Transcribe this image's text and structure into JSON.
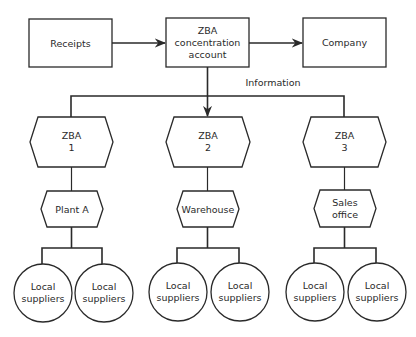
{
  "diagram": {
    "type": "flowchart",
    "colors": {
      "stroke": "#2a2a2a",
      "fill": "#ffffff",
      "text": "#2a2a2a"
    },
    "top_row": {
      "receipts": {
        "label": "Receipts"
      },
      "concentration": {
        "line1": "ZBA",
        "line2": "concentration",
        "line3": "account"
      },
      "company": {
        "label": "Company"
      }
    },
    "information_label": "Information",
    "branches": [
      {
        "zba": {
          "line1": "ZBA",
          "line2": "1"
        },
        "unit": {
          "line1": "Plant A",
          "line2": ""
        },
        "suppliers": [
          {
            "line1": "Local",
            "line2": "suppliers"
          },
          {
            "line1": "Local",
            "line2": "suppliers"
          }
        ]
      },
      {
        "zba": {
          "line1": "ZBA",
          "line2": "2"
        },
        "unit": {
          "line1": "Warehouse",
          "line2": ""
        },
        "suppliers": [
          {
            "line1": "Local",
            "line2": "suppliers"
          },
          {
            "line1": "Local",
            "line2": "suppliers"
          }
        ]
      },
      {
        "zba": {
          "line1": "ZBA",
          "line2": "3"
        },
        "unit": {
          "line1": "Sales",
          "line2": "office"
        },
        "suppliers": [
          {
            "line1": "Local",
            "line2": "suppliers"
          },
          {
            "line1": "Local",
            "line2": "suppliers"
          }
        ]
      }
    ],
    "edges": [
      {
        "from": "Receipts",
        "to": "ZBA concentration account",
        "arrow": true
      },
      {
        "from": "ZBA concentration account",
        "to": "Company",
        "arrow": true
      },
      {
        "from": "ZBA concentration account",
        "to": "ZBA 1 / ZBA 2 / ZBA 3",
        "label": "Information",
        "arrow": true
      },
      {
        "from": "ZBA 1",
        "to": "Plant A"
      },
      {
        "from": "ZBA 2",
        "to": "Warehouse"
      },
      {
        "from": "ZBA 3",
        "to": "Sales office"
      },
      {
        "from": "Plant A",
        "to": "Local suppliers (x2)"
      },
      {
        "from": "Warehouse",
        "to": "Local suppliers (x2)"
      },
      {
        "from": "Sales office",
        "to": "Local suppliers (x2)"
      }
    ]
  }
}
